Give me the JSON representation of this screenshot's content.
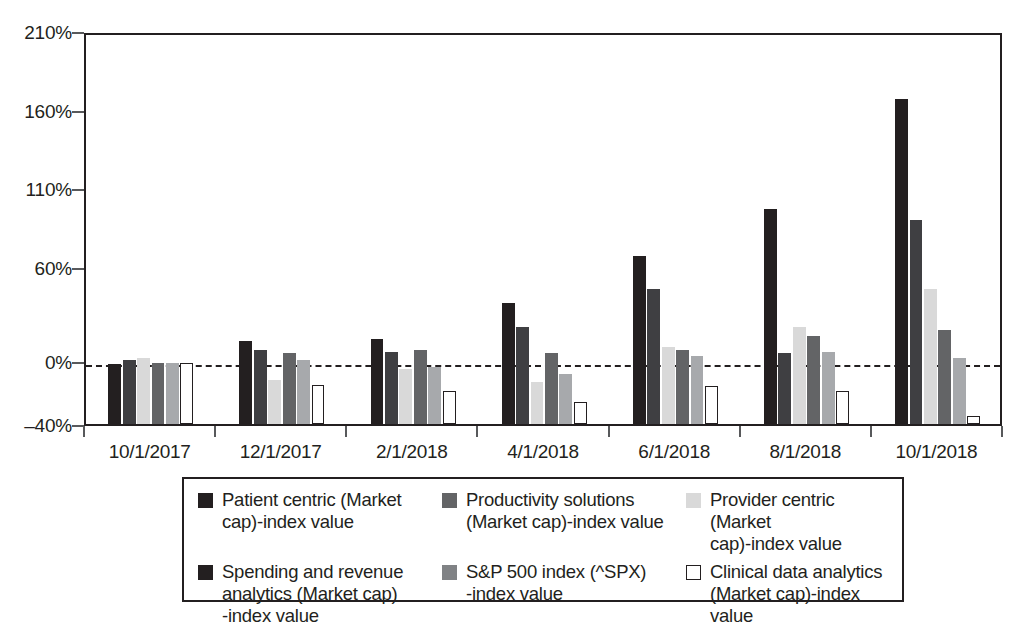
{
  "chart_data": {
    "type": "bar",
    "title": "",
    "subtitle": "",
    "xlabel": "",
    "ylabel": "",
    "grid": false,
    "legend_position": "bottom",
    "categories": [
      "10/1/2017",
      "12/1/2017",
      "2/1/2018",
      "4/1/2018",
      "6/1/2018",
      "8/1/2018",
      "10/1/2018"
    ],
    "ylim": [
      -40,
      210
    ],
    "yticks": [
      -40,
      0,
      60,
      110,
      160,
      210
    ],
    "ytick_labels": [
      "–40%",
      "0%",
      "60%",
      "110%",
      "160%",
      "210%"
    ],
    "zero_reference_line": "0%",
    "series": [
      {
        "name": "Patient centric (Market cap)-index value",
        "color": "#231f20",
        "values": [
          -2,
          13,
          14,
          37,
          67,
          97,
          167
        ]
      },
      {
        "name": "Productivity solutions (Market cap)-index value",
        "color": "#3f3f42",
        "values": [
          1,
          7,
          6,
          22,
          46,
          5,
          90
        ]
      },
      {
        "name": "Provider centric (Market cap)-index value",
        "color": "#d9d9d9",
        "values": [
          2,
          -12,
          -5,
          -13,
          9,
          22,
          46
        ]
      },
      {
        "name": "Spending and revenue analytics (Market cap)-index value",
        "color": "#636466",
        "values": [
          -1,
          5,
          7,
          5,
          7,
          16,
          20
        ]
      },
      {
        "name": "S&P 500 index (^SPX)-index value",
        "color": "#a7a9ac",
        "values": [
          -1,
          1,
          -4,
          -8,
          3,
          6,
          2
        ]
      },
      {
        "name": "Clinical data analytics (Market cap)-index value",
        "color": "#ffffff",
        "values": [
          -1,
          -15,
          -19,
          -26,
          -16,
          -19,
          -35
        ]
      }
    ]
  },
  "legend": {
    "items": [
      {
        "label": "Patient centric (Market cap)-index value",
        "color": "#231f20",
        "border": "#231f20"
      },
      {
        "label": "Productivity solutions (Market cap)-index value",
        "color": "#636466",
        "border": "#636466"
      },
      {
        "label": "Provider centric (Market cap)-index value",
        "color": "#d9d9d9",
        "border": "#d9d9d9"
      },
      {
        "label": "Spending and revenue analytics (Market cap)-index value",
        "color": "#231f20",
        "border": "#231f20"
      },
      {
        "label": "S&P 500 index (^SPX)-index value",
        "color": "#808285",
        "border": "#808285"
      },
      {
        "label": "Clinical data analytics (Market cap)-index value",
        "color": "#ffffff",
        "border": "#231f20"
      }
    ],
    "display_lines": [
      [
        "Patient centric (Market",
        "cap)-index value"
      ],
      [
        "Productivity solutions",
        "(Market cap)-index value"
      ],
      [
        "Provider centric (Market",
        "cap)-index value"
      ],
      [
        "Spending and revenue",
        "analytics (Market cap)",
        "-index value"
      ],
      [
        "S&P 500 index (^SPX)",
        "-index value"
      ],
      [
        "Clinical data analytics",
        "(Market cap)-index value"
      ]
    ]
  },
  "axis": {
    "y_tick_labels": [
      "210%",
      "160%",
      "110%",
      "60%",
      "0%",
      "–40%"
    ],
    "x_tick_labels": [
      "10/1/2017",
      "12/1/2017",
      "2/1/2018",
      "4/1/2018",
      "6/1/2018",
      "8/1/2018",
      "10/1/2018"
    ]
  }
}
